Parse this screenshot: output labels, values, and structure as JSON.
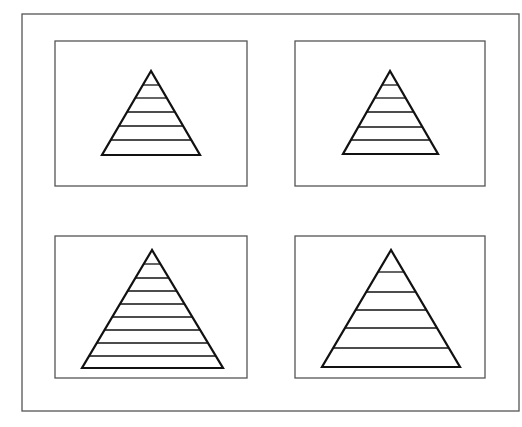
{
  "figure": {
    "width": 522,
    "height": 427,
    "background": "#ffffff",
    "stroke_color": "#111111",
    "frame_color": "#555555",
    "outer_frame": {
      "x": 22,
      "y": 14,
      "w": 497,
      "h": 397
    }
  },
  "panels": [
    {
      "id": "top-left",
      "box": {
        "x": 55,
        "y": 41,
        "w": 192,
        "h": 145
      },
      "triangle": {
        "apex": [
          151,
          71
        ],
        "base_left": [
          102,
          155
        ],
        "base_right": [
          200,
          155
        ]
      },
      "sections": 6,
      "dividers_y": [
        85,
        98,
        112,
        126,
        140
      ]
    },
    {
      "id": "top-right",
      "box": {
        "x": 295,
        "y": 41,
        "w": 190,
        "h": 145
      },
      "triangle": {
        "apex": [
          390,
          71
        ],
        "base_left": [
          343,
          154
        ],
        "base_right": [
          438,
          154
        ]
      },
      "sections": 6,
      "dividers_y": [
        85,
        98,
        112,
        127,
        140
      ]
    },
    {
      "id": "bottom-left",
      "box": {
        "x": 55,
        "y": 236,
        "w": 192,
        "h": 142
      },
      "triangle": {
        "apex": [
          152,
          250
        ],
        "base_left": [
          82,
          368
        ],
        "base_right": [
          223,
          368
        ]
      },
      "sections": 9,
      "dividers_y": [
        264,
        278,
        291,
        304,
        317,
        330,
        343,
        356
      ]
    },
    {
      "id": "bottom-right",
      "box": {
        "x": 295,
        "y": 236,
        "w": 190,
        "h": 142
      },
      "triangle": {
        "apex": [
          391,
          250
        ],
        "base_left": [
          322,
          367
        ],
        "base_right": [
          460,
          367
        ]
      },
      "sections": 6,
      "dividers_y": [
        272,
        292,
        310,
        328,
        348
      ]
    }
  ]
}
